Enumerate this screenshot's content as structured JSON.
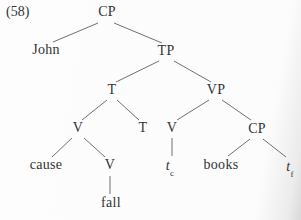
{
  "figure": {
    "example_number": "(58)",
    "type": "syntax-tree"
  },
  "colors": {
    "text": "#333333",
    "line": "#707070",
    "background": "#fdfdfd"
  },
  "nodes": {
    "cp_root": {
      "label": "CP"
    },
    "john": {
      "label": "John"
    },
    "tp": {
      "label": "TP"
    },
    "t_head": {
      "label": "T"
    },
    "vp": {
      "label": "VP"
    },
    "v_complex": {
      "label": "V"
    },
    "t_lower": {
      "label": "T"
    },
    "v_vp": {
      "label": "V"
    },
    "cp_lower": {
      "label": "CP"
    },
    "cause": {
      "label": "cause"
    },
    "v_inner": {
      "label": "V"
    },
    "trace_c": {
      "base": "t",
      "sub": "c"
    },
    "books": {
      "label": "books"
    },
    "trace_f": {
      "base": "t",
      "sub": "f"
    },
    "fall": {
      "label": "fall"
    }
  },
  "structure": {
    "label": "CP",
    "children": [
      {
        "label": "John"
      },
      {
        "label": "TP",
        "children": [
          {
            "label": "T",
            "children": [
              {
                "label": "V",
                "children": [
                  {
                    "label": "cause"
                  },
                  {
                    "label": "V",
                    "children": [
                      {
                        "label": "fall"
                      }
                    ]
                  }
                ]
              },
              {
                "label": "T"
              }
            ]
          },
          {
            "label": "VP",
            "children": [
              {
                "label": "V",
                "children": [
                  {
                    "label": "t_c"
                  }
                ]
              },
              {
                "label": "CP",
                "children": [
                  {
                    "label": "books"
                  },
                  {
                    "label": "t_f"
                  }
                ]
              }
            ]
          }
        ]
      }
    ]
  }
}
